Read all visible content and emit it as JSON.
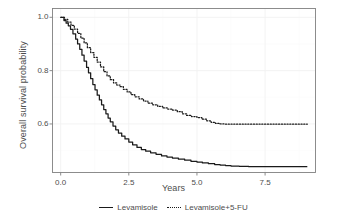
{
  "chart_data": {
    "type": "line",
    "title": "",
    "subtitle": "",
    "xlabel": "Years",
    "ylabel": "Overall survival probability",
    "xlim": [
      -0.3,
      9.35
    ],
    "ylim": [
      0.418,
      1.033
    ],
    "xticks": [
      0.0,
      2.5,
      5.0,
      7.5
    ],
    "xticklabels": [
      "0.0",
      "2.5",
      "5.0",
      "7.5"
    ],
    "yticks": [
      1.0,
      0.8,
      0.6
    ],
    "yticklabels": [
      "1.0",
      "0.8",
      "0.6"
    ],
    "grid": true,
    "grid_color": "#fbfbfb",
    "legend_position": "bottom",
    "panel_border_color": "#808080",
    "series": [
      {
        "name": "Levamisole",
        "linestyle": "solid",
        "color": "#1a1a1a",
        "x": [
          0.0,
          0.12,
          0.2,
          0.28,
          0.36,
          0.45,
          0.55,
          0.62,
          0.7,
          0.78,
          0.86,
          0.95,
          1.02,
          1.1,
          1.18,
          1.26,
          1.34,
          1.42,
          1.5,
          1.58,
          1.66,
          1.74,
          1.82,
          1.92,
          2.02,
          2.12,
          2.24,
          2.36,
          2.5,
          2.64,
          2.8,
          2.96,
          3.12,
          3.3,
          3.5,
          3.7,
          3.9,
          4.1,
          4.32,
          4.55,
          4.78,
          5.0,
          5.2,
          5.42,
          5.65,
          5.85,
          6.05,
          6.25,
          6.55,
          6.9,
          7.4,
          8.0,
          8.6,
          9.05
        ],
        "y": [
          1.0,
          0.988,
          0.978,
          0.968,
          0.955,
          0.938,
          0.918,
          0.9,
          0.88,
          0.858,
          0.836,
          0.812,
          0.792,
          0.77,
          0.748,
          0.728,
          0.708,
          0.69,
          0.672,
          0.654,
          0.638,
          0.622,
          0.608,
          0.592,
          0.578,
          0.566,
          0.554,
          0.544,
          0.532,
          0.522,
          0.512,
          0.504,
          0.498,
          0.492,
          0.486,
          0.48,
          0.476,
          0.472,
          0.468,
          0.464,
          0.46,
          0.457,
          0.454,
          0.451,
          0.448,
          0.446,
          0.444,
          0.442,
          0.441,
          0.44,
          0.44,
          0.44,
          0.44,
          0.44
        ]
      },
      {
        "name": "Levamisole+5-FU",
        "linestyle": "dotted",
        "color": "#1a1a1a",
        "x": [
          0.0,
          0.14,
          0.26,
          0.38,
          0.5,
          0.62,
          0.74,
          0.86,
          0.98,
          1.1,
          1.22,
          1.34,
          1.46,
          1.58,
          1.7,
          1.82,
          1.94,
          2.06,
          2.18,
          2.3,
          2.44,
          2.58,
          2.72,
          2.88,
          3.04,
          3.2,
          3.38,
          3.56,
          3.74,
          3.92,
          4.1,
          4.28,
          4.46,
          4.62,
          4.8,
          5.0,
          5.18,
          5.36,
          5.52,
          5.68,
          5.85,
          6.05,
          6.4,
          6.9,
          7.5,
          8.1,
          8.7,
          9.05
        ],
        "y": [
          1.0,
          0.992,
          0.982,
          0.97,
          0.956,
          0.94,
          0.922,
          0.904,
          0.886,
          0.868,
          0.85,
          0.832,
          0.814,
          0.796,
          0.78,
          0.766,
          0.754,
          0.746,
          0.74,
          0.73,
          0.72,
          0.71,
          0.702,
          0.694,
          0.686,
          0.678,
          0.672,
          0.666,
          0.66,
          0.656,
          0.652,
          0.646,
          0.638,
          0.632,
          0.628,
          0.624,
          0.618,
          0.612,
          0.606,
          0.602,
          0.6,
          0.599,
          0.599,
          0.599,
          0.599,
          0.599,
          0.599,
          0.599
        ]
      }
    ]
  },
  "legend": {
    "entries": [
      {
        "label": "Levamisole",
        "style": "solid"
      },
      {
        "label": "Levamisole+5-FU",
        "style": "dotted"
      }
    ]
  }
}
